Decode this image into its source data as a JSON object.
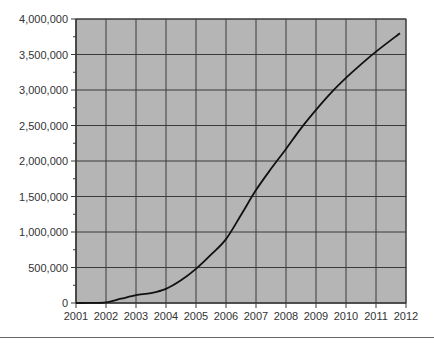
{
  "chart_data": {
    "type": "line",
    "title": "",
    "xlabel": "",
    "ylabel": "",
    "xlim": [
      2001,
      2012
    ],
    "ylim": [
      0,
      4000000
    ],
    "grid": true,
    "legend": null,
    "x_ticks": [
      2001,
      2002,
      2003,
      2004,
      2005,
      2006,
      2007,
      2008,
      2009,
      2010,
      2011,
      2012
    ],
    "x_tick_labels": [
      "2001",
      "2002",
      "2003",
      "2004",
      "2005",
      "2006",
      "2007",
      "2008",
      "2009",
      "2010",
      "2011",
      "2012"
    ],
    "y_ticks": [
      0,
      500000,
      1000000,
      1500000,
      2000000,
      2500000,
      3000000,
      3500000,
      4000000
    ],
    "y_tick_labels": [
      "0",
      "500,000",
      "1,000,000",
      "1,500,000",
      "2,000,000",
      "2,500,000",
      "3,000,000",
      "3,500,000",
      "4,000,000"
    ],
    "y_minor_step": 250000,
    "series": [
      {
        "name": "Total",
        "x": [
          2001,
          2001.5,
          2002,
          2002.5,
          2003,
          2003.5,
          2004,
          2004.5,
          2005,
          2005.5,
          2006,
          2006.5,
          2007,
          2007.5,
          2008,
          2008.5,
          2009,
          2009.5,
          2010,
          2010.5,
          2011,
          2011.8
        ],
        "values": [
          0,
          2000,
          10000,
          60000,
          110000,
          140000,
          200000,
          320000,
          480000,
          680000,
          900000,
          1240000,
          1590000,
          1890000,
          2170000,
          2460000,
          2720000,
          2960000,
          3170000,
          3360000,
          3540000,
          3800000
        ]
      }
    ]
  },
  "style": {
    "plot_fill": "#b5b5b5",
    "grid_color": "#3a3a3a",
    "line_color": "#111111",
    "axis_text_color": "#333333"
  }
}
